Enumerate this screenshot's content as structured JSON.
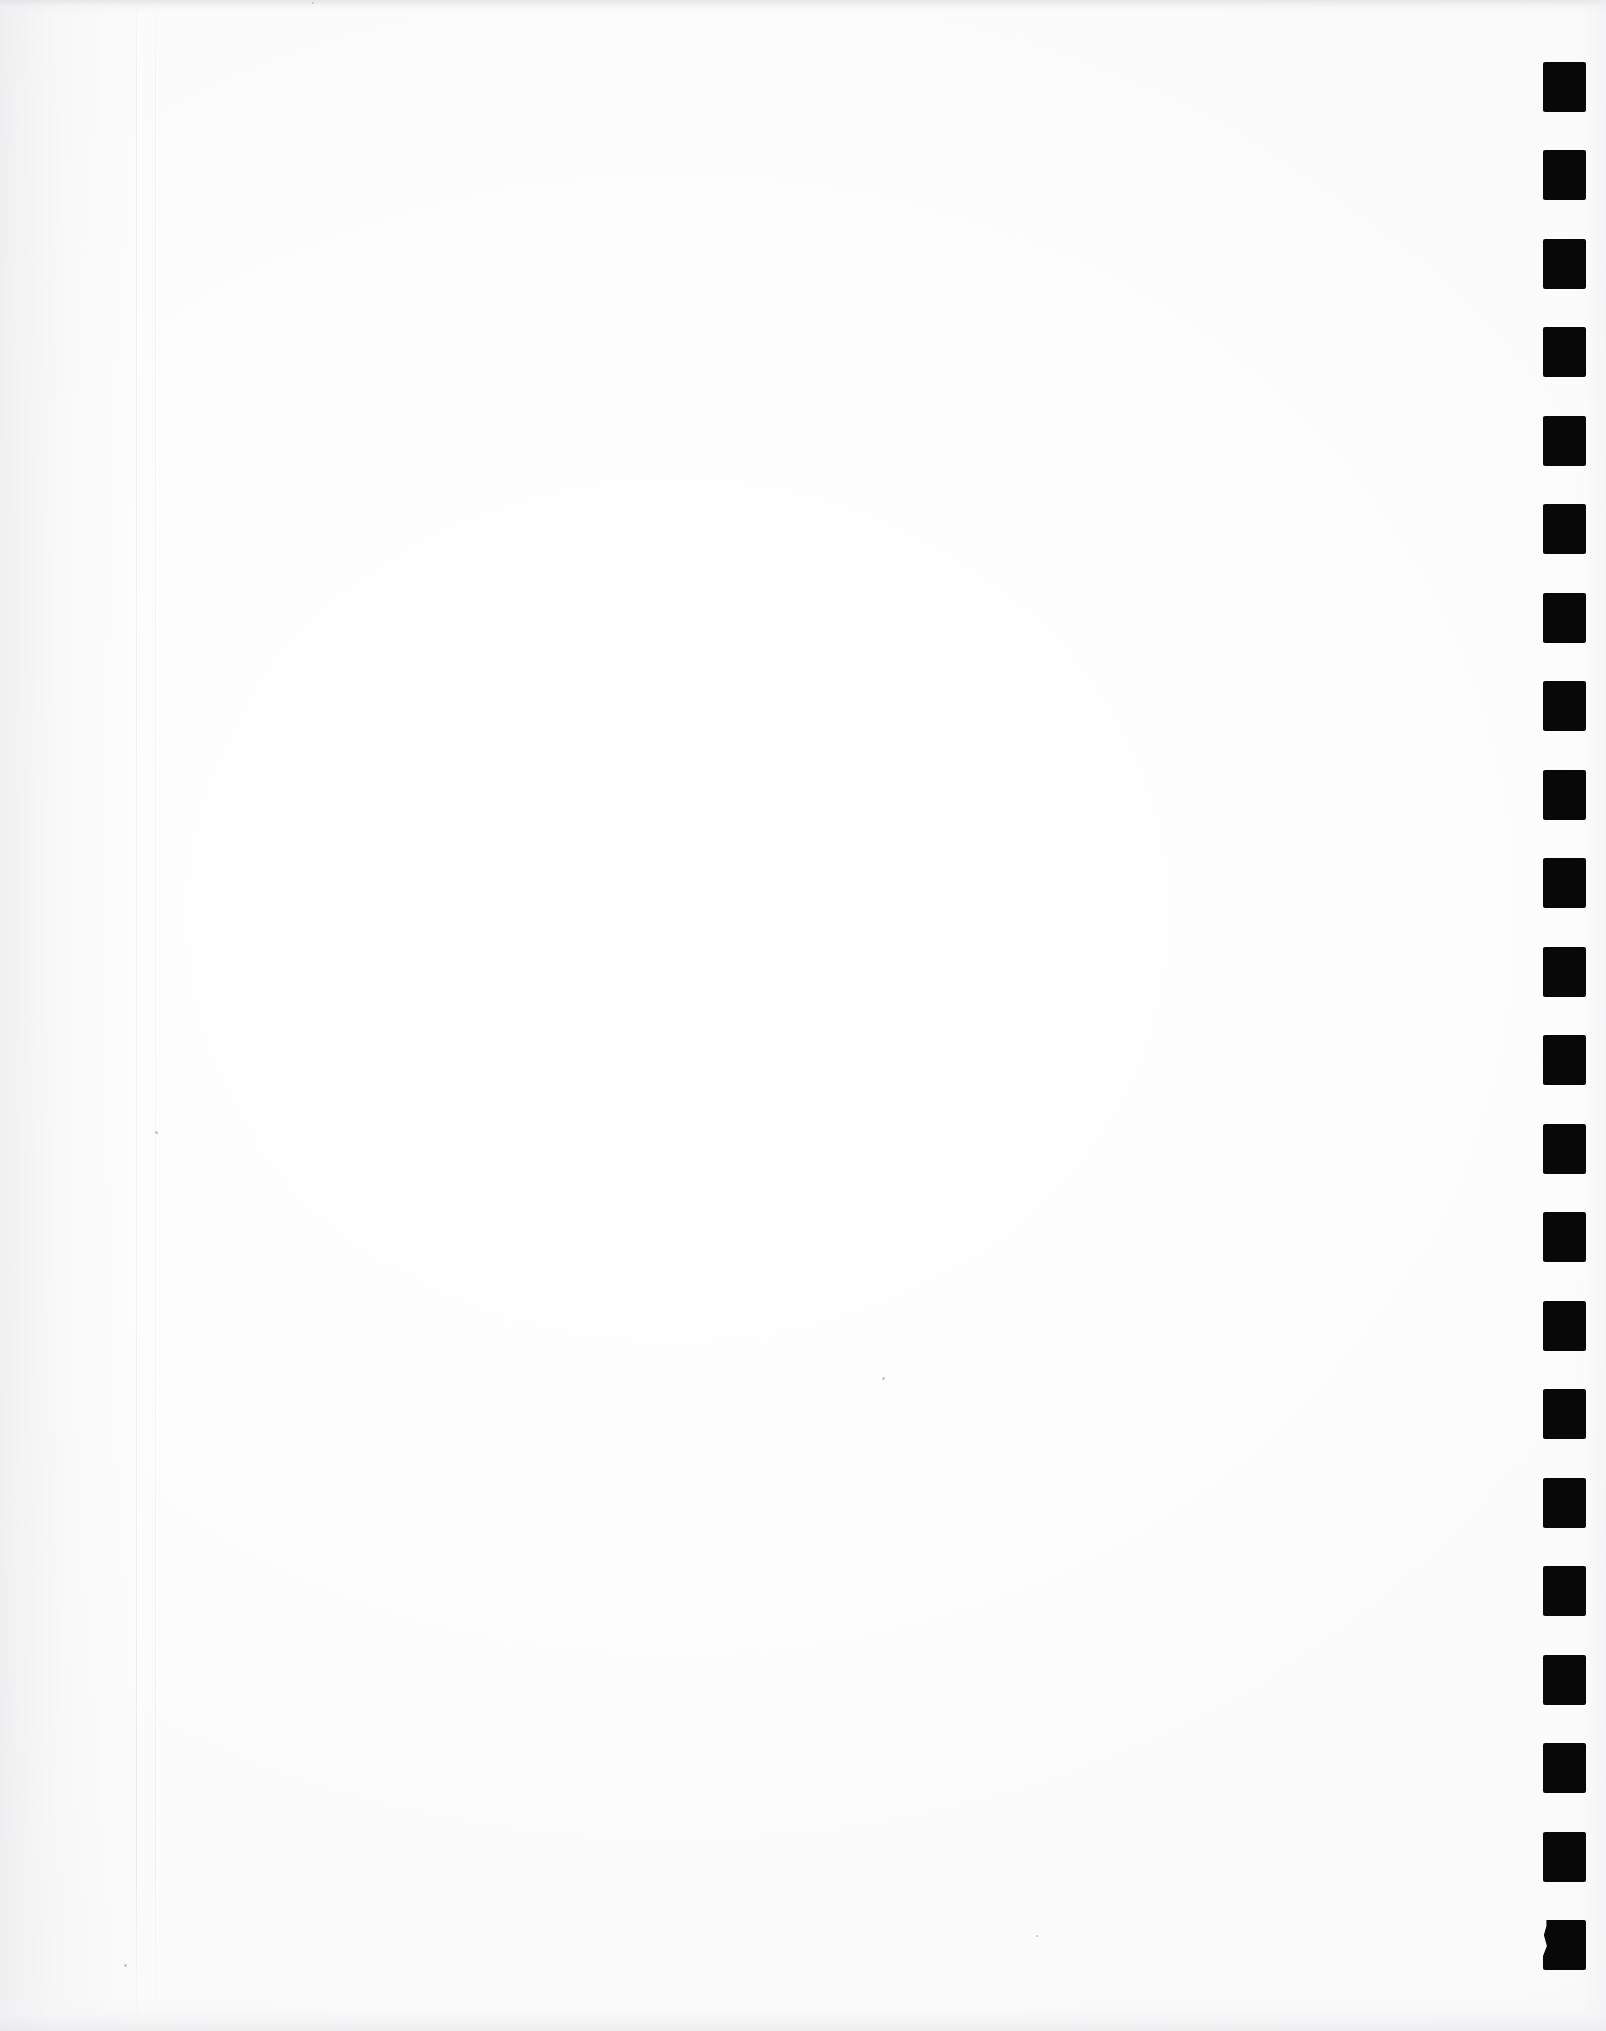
{
  "document": {
    "kind": "scanned-page",
    "title": "Blank scanned page with right-margin register markers",
    "page_width": 1606,
    "page_height": 2031,
    "paper_color": "#fcfcfc",
    "marker_color": "#080808",
    "content_text": "",
    "visible_text": ""
  },
  "markers": {
    "label": "register-markers",
    "count": 22,
    "shape": "filled-square",
    "color": "#080808",
    "left": 1543,
    "width": 43,
    "height": 50,
    "first_top": 62,
    "pitch": 88.4,
    "last_is_irregular": true,
    "positions_top": [
      62,
      150,
      239,
      327,
      416,
      504,
      593,
      681,
      770,
      858,
      947,
      1035,
      1124,
      1212,
      1301,
      1389,
      1478,
      1566,
      1655,
      1743,
      1832,
      1920
    ]
  },
  "creases": {
    "label": "page-creases",
    "lines": [
      {
        "x": 136,
        "opacity": 0.5
      },
      {
        "x": 155,
        "opacity": 0.32
      }
    ]
  },
  "specks": [
    {
      "x": 155,
      "y": 1131,
      "size": 3
    },
    {
      "x": 882,
      "y": 1377,
      "size": 3
    },
    {
      "x": 124,
      "y": 1964,
      "size": 3
    },
    {
      "x": 312,
      "y": 2,
      "size": 2
    },
    {
      "x": 1036,
      "y": 1935,
      "size": 2
    }
  ]
}
